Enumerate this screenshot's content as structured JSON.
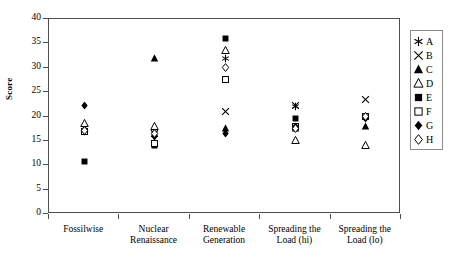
{
  "chart_data": {
    "type": "scatter",
    "title": "",
    "xlabel": "",
    "ylabel": "Score",
    "ylim": [
      0,
      40
    ],
    "yticks": [
      0,
      5,
      10,
      15,
      20,
      25,
      30,
      35,
      40
    ],
    "grid": false,
    "legend_position": "right",
    "categories": [
      "Fossilwise",
      "Nuclear Renaissance",
      "Renewable Generation",
      "Spreading the Load (hi)",
      "Spreading the Load (lo)"
    ],
    "category_labels_wrapped": [
      [
        "Fossilwise"
      ],
      [
        "Nuclear",
        "Renaissance"
      ],
      [
        "Renewable",
        "Generation"
      ],
      [
        "Spreading the",
        "Load (hi)"
      ],
      [
        "Spreading the",
        "Load (lo)"
      ]
    ],
    "series": [
      {
        "name": "A",
        "marker": "asterisk",
        "values": [
          17.0,
          16.5,
          32.0,
          22.0,
          20.0
        ]
      },
      {
        "name": "B",
        "marker": "cross",
        "values": [
          17.5,
          16.5,
          21.0,
          22.3,
          23.5
        ]
      },
      {
        "name": "C",
        "marker": "filled-triangle",
        "values": [
          17.0,
          32.0,
          17.5,
          17.5,
          18.0
        ]
      },
      {
        "name": "D",
        "marker": "open-triangle",
        "values": [
          18.5,
          18.0,
          33.5,
          15.0,
          14.0
        ]
      },
      {
        "name": "E",
        "marker": "filled-square",
        "values": [
          10.8,
          14.0,
          36.0,
          19.5,
          20.0
        ]
      },
      {
        "name": "F",
        "marker": "open-square",
        "values": [
          17.0,
          14.5,
          27.5,
          18.0,
          20.0
        ]
      },
      {
        "name": "G",
        "marker": "filled-diamond",
        "values": [
          22.2,
          16.0,
          16.5,
          18.0,
          19.5
        ]
      },
      {
        "name": "H",
        "marker": "open-diamond",
        "values": [
          17.2,
          16.5,
          30.0,
          17.5,
          20.0
        ]
      }
    ]
  },
  "legend": {
    "items": [
      {
        "label": "A",
        "marker": "asterisk"
      },
      {
        "label": "B",
        "marker": "cross"
      },
      {
        "label": "C",
        "marker": "filled-triangle"
      },
      {
        "label": "D",
        "marker": "open-triangle"
      },
      {
        "label": "E",
        "marker": "filled-square"
      },
      {
        "label": "F",
        "marker": "open-square"
      },
      {
        "label": "G",
        "marker": "filled-diamond"
      },
      {
        "label": "H",
        "marker": "open-diamond"
      }
    ]
  },
  "colors": {
    "marker": "#000000",
    "axis": "#4d4d4d",
    "legend_border": "#8a8a8a",
    "background": "#ffffff"
  }
}
